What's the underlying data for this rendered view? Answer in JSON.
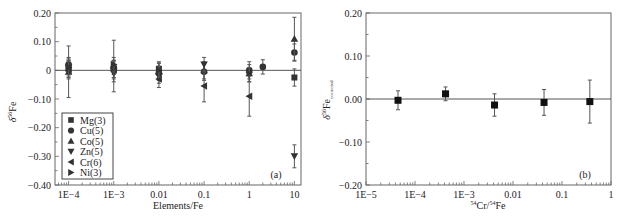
{
  "chart_data": [
    {
      "id": "a",
      "type": "scatter",
      "panel_label": "(a)",
      "xlabel": "Elements/Fe",
      "ylabel": "δ56Fe",
      "ylabel_main": "δ",
      "ylabel_sup": "56",
      "ylabel_tail": "Fe",
      "xscale": "log",
      "xlim": [
        5e-05,
        14
      ],
      "ylim": [
        -0.4,
        0.2
      ],
      "xticks": [
        {
          "value": 0.0001,
          "label": "1E−4"
        },
        {
          "value": 0.001,
          "label": "1E−3"
        },
        {
          "value": 0.01,
          "label": "0.01"
        },
        {
          "value": 0.1,
          "label": "0.1"
        },
        {
          "value": 1,
          "label": "1"
        },
        {
          "value": 10,
          "label": "10"
        }
      ],
      "yticks": [
        {
          "value": 0.2,
          "label": "0.20"
        },
        {
          "value": 0.1,
          "label": "0.10"
        },
        {
          "value": 0,
          "label": "0"
        },
        {
          "value": -0.1,
          "label": "-0.10"
        },
        {
          "value": -0.2,
          "label": "-0.20"
        },
        {
          "value": -0.3,
          "label": "-0.30"
        },
        {
          "value": -0.4,
          "label": "-0.40"
        }
      ],
      "reference_line_y": 0,
      "legend_position": "bottom-left",
      "series": [
        {
          "name": "Mg(3)",
          "marker": "square",
          "points": [
            {
              "x": 0.0001,
              "y": 0.005,
              "err": 0.03
            },
            {
              "x": 0.001,
              "y": 0.005,
              "err": 0.03
            },
            {
              "x": 0.01,
              "y": 0.005,
              "err": 0.025
            },
            {
              "x": 10,
              "y": -0.025,
              "err": 0.03
            }
          ]
        },
        {
          "name": "Cu(5)",
          "marker": "circle",
          "points": [
            {
              "x": 0.0001,
              "y": 0.02,
              "err": 0.025
            },
            {
              "x": 0.001,
              "y": 0.01,
              "err": 0.025
            },
            {
              "x": 0.01,
              "y": -0.01,
              "err": 0.025
            },
            {
              "x": 0.1,
              "y": -0.005,
              "err": 0.03
            },
            {
              "x": 1,
              "y": 0.0,
              "err": 0.03
            },
            {
              "x": 2,
              "y": 0.012,
              "err": 0.025
            },
            {
              "x": 10,
              "y": 0.062,
              "err": 0.03
            }
          ]
        },
        {
          "name": "Co(5)",
          "marker": "triangle-up",
          "points": [
            {
              "x": 0.0001,
              "y": -0.005,
              "err": 0.09
            },
            {
              "x": 0.001,
              "y": 0.015,
              "err": 0.09
            },
            {
              "x": 0.01,
              "y": -0.005,
              "err": 0.03
            },
            {
              "x": 0.1,
              "y": 0.0,
              "err": 0.03
            },
            {
              "x": 1,
              "y": -0.01,
              "err": 0.03
            },
            {
              "x": 10,
              "y": 0.11,
              "err": 0.075
            }
          ]
        },
        {
          "name": "Zn(5)",
          "marker": "triangle-down",
          "points": [
            {
              "x": 0.0001,
              "y": 0.01,
              "err": 0.03
            },
            {
              "x": 0.001,
              "y": -0.01,
              "err": 0.03
            },
            {
              "x": 0.01,
              "y": -0.02,
              "err": 0.025
            },
            {
              "x": 0.1,
              "y": 0.02,
              "err": 0.025
            },
            {
              "x": 1,
              "y": -0.015,
              "err": 0.025
            },
            {
              "x": 10,
              "y": -0.3,
              "err": 0.04
            }
          ]
        },
        {
          "name": "Cr(6)",
          "marker": "triangle-left",
          "points": [
            {
              "x": 0.0001,
              "y": 0.0,
              "err": 0.03
            },
            {
              "x": 0.001,
              "y": 0.0,
              "err": 0.03
            },
            {
              "x": 0.01,
              "y": -0.03,
              "err": 0.03
            },
            {
              "x": 0.1,
              "y": -0.055,
              "err": 0.055
            },
            {
              "x": 1,
              "y": -0.09,
              "err": 0.07
            }
          ]
        },
        {
          "name": "Ni(3)",
          "marker": "triangle-right",
          "points": [
            {
              "x": 0.0001,
              "y": 0.01,
              "err": 0.025
            },
            {
              "x": 0.001,
              "y": 0.02,
              "err": 0.025
            },
            {
              "x": 0.01,
              "y": 0.0,
              "err": 0.025
            }
          ]
        }
      ]
    },
    {
      "id": "b",
      "type": "scatter",
      "panel_label": "(b)",
      "xlabel": "54Cr/54Fe",
      "xlabel_sup1": "54",
      "xlabel_mid": "Cr/",
      "xlabel_sup2": "54",
      "xlabel_tail": "Fe",
      "ylabel": "δ56Fe corrected",
      "ylabel_main": "δ",
      "ylabel_sup": "56",
      "ylabel_tail": "Fe",
      "ylabel_sub": "corrected",
      "xscale": "log",
      "xlim": [
        1e-05,
        1
      ],
      "ylim": [
        -0.2,
        0.2
      ],
      "xticks": [
        {
          "value": 1e-05,
          "label": "1E−5"
        },
        {
          "value": 0.0001,
          "label": "1E−4"
        },
        {
          "value": 0.001,
          "label": "1E−3"
        },
        {
          "value": 0.01,
          "label": "0.01"
        },
        {
          "value": 0.1,
          "label": "0.1"
        },
        {
          "value": 1,
          "label": "1"
        }
      ],
      "yticks": [
        {
          "value": 0.2,
          "label": "0.20"
        },
        {
          "value": 0.1,
          "label": "0.10"
        },
        {
          "value": 0.0,
          "label": "0.00"
        },
        {
          "value": -0.1,
          "label": "-0.10"
        },
        {
          "value": -0.2,
          "label": "-0.20"
        }
      ],
      "reference_line_y": 0,
      "series": [
        {
          "name": "Cr corrected",
          "marker": "square",
          "points": [
            {
              "x": 4.5e-05,
              "y": -0.003,
              "err": 0.022
            },
            {
              "x": 0.00042,
              "y": 0.012,
              "err": 0.016
            },
            {
              "x": 0.0042,
              "y": -0.014,
              "err": 0.026
            },
            {
              "x": 0.043,
              "y": -0.008,
              "err": 0.03
            },
            {
              "x": 0.37,
              "y": -0.006,
              "err": 0.05
            }
          ]
        }
      ]
    }
  ]
}
